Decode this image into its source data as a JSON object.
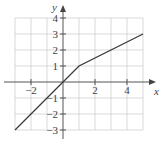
{
  "chart_data": {
    "type": "line",
    "title": "",
    "xlabel": "x",
    "ylabel": "y",
    "xlim": [
      -3,
      5
    ],
    "ylim": [
      -3,
      4
    ],
    "grid": true,
    "legend": null,
    "x_ticks": [
      {
        "value": -2,
        "label": "−2"
      },
      {
        "value": 2,
        "label": "2"
      },
      {
        "value": 4,
        "label": "4"
      }
    ],
    "y_ticks": [
      {
        "value": 4,
        "label": "4"
      },
      {
        "value": 3,
        "label": "3"
      },
      {
        "value": 2,
        "label": "2"
      },
      {
        "value": 1,
        "label": "1"
      },
      {
        "value": -1,
        "label": "−1"
      },
      {
        "value": -2,
        "label": "−2"
      },
      {
        "value": -3,
        "label": "−3"
      }
    ],
    "series": [
      {
        "name": "piecewise linear",
        "points": [
          [
            -3,
            -3
          ],
          [
            0,
            0
          ],
          [
            1,
            1
          ],
          [
            5,
            3
          ]
        ],
        "x": [
          -3,
          0,
          1,
          5
        ],
        "values": [
          -3,
          0,
          1,
          3
        ]
      }
    ]
  },
  "layout": {
    "origin_px": [
      63,
      82
    ],
    "unit_px": 16,
    "x_axis_end_px": 156,
    "x_axis_start_px": 4,
    "y_axis_top_px": 5,
    "y_axis_bottom_px": 139
  },
  "colors": {
    "grid": "#c8c8c8",
    "axis": "#555555",
    "curve": "#3a3a3a",
    "text": "#444444"
  }
}
